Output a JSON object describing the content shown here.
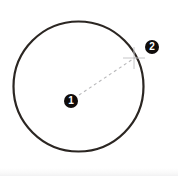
{
  "figure": {
    "background_color": "#ffffff",
    "width": 178,
    "height": 176,
    "circle": {
      "center_x": 78.5,
      "center_y": 86.5,
      "radius": 65,
      "stroke_color": "#2b2622",
      "stroke_width": 2.2,
      "fill": "none"
    },
    "radius_line": {
      "label": "radius",
      "from_x": 79,
      "from_y": 95,
      "to_x": 136,
      "to_y": 57,
      "stroke_color": "#b9b9bb",
      "stroke_width": 1.1,
      "dash": "3 3"
    },
    "edge_crosshair": {
      "center_x": 134,
      "center_y": 58,
      "arm_length": 11,
      "stroke_color": "#c6c6c8",
      "stroke_width": 1
    },
    "callouts": [
      {
        "id": "callout-1",
        "label": "1",
        "x": 71,
        "y": 101,
        "diameter": 14,
        "fill_color": "#100c0a",
        "text_color": "#ffffff"
      },
      {
        "id": "callout-2",
        "label": "2",
        "x": 152,
        "y": 47,
        "diameter": 14,
        "fill_color": "#100c0a",
        "text_color": "#ffffff"
      }
    ],
    "bottom_band_color": "#f2f2f3"
  }
}
